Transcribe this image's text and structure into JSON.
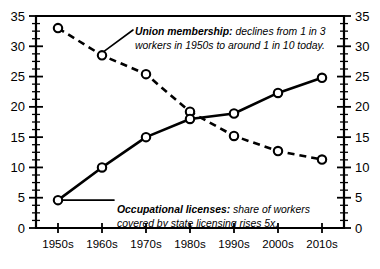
{
  "chart_data": {
    "type": "line",
    "title": "",
    "xlabel": "",
    "ylabel": "",
    "ylim": [
      0,
      35
    ],
    "y_ticks": [
      0,
      5,
      10,
      15,
      20,
      25,
      30,
      35
    ],
    "y_minor_step": 1.25,
    "dual_axis": true,
    "right_axis_ticks": [
      0,
      5,
      10,
      15,
      20,
      25,
      30,
      35
    ],
    "grid": false,
    "legend": "none",
    "categories": [
      "1950s",
      "1960s",
      "1970s",
      "1980s",
      "1990s",
      "2000s",
      "2010s"
    ],
    "series": [
      {
        "name": "Union membership",
        "style": "dashed",
        "marker": "open-circle",
        "values": [
          33.0,
          28.5,
          25.4,
          19.2,
          15.2,
          12.7,
          11.3
        ]
      },
      {
        "name": "Occupational licenses",
        "style": "solid",
        "marker": "open-circle",
        "values": [
          4.6,
          10.0,
          15.0,
          18.0,
          18.9,
          22.3,
          24.8
        ]
      }
    ],
    "annotations": [
      {
        "id": "union",
        "lead": "Union membership:",
        "line1": " declines from 1 in 3",
        "line2": "workers in 1950s to around 1 in 10 today.",
        "target_category": "1960s",
        "target_series": "Union membership"
      },
      {
        "id": "licenses",
        "lead": "Occupational licenses:",
        "line1": " share of workers",
        "line2": "covered by state licensing rises 5x.",
        "target_category": "1950s",
        "target_series": "Occupational licenses"
      }
    ]
  },
  "colors": {
    "ink": "#000000",
    "background": "#ffffff",
    "marker_fill": "#ffffff"
  }
}
